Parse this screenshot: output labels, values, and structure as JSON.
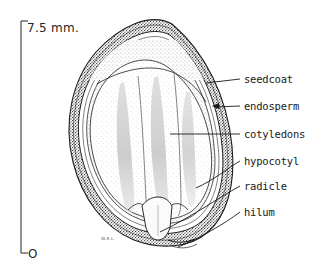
{
  "figure": {
    "kind": "botanical-seed-cross-section-diagram",
    "background_color": "#ffffff",
    "ink_color": "#1a1a1a",
    "signature": "W.R.L."
  },
  "scale": {
    "top_label": "7.5 mm.",
    "bottom_label": "O",
    "bar_color": "#3a3a3a"
  },
  "labels": [
    {
      "id": "seedcoat",
      "text": "seedcoat"
    },
    {
      "id": "endosperm",
      "text": "endosperm"
    },
    {
      "id": "cotyledons",
      "text": "cotyledons"
    },
    {
      "id": "hypocotyl",
      "text": "hypocotyl"
    },
    {
      "id": "radicle",
      "text": "radicle"
    },
    {
      "id": "hilum",
      "text": "hilum"
    }
  ]
}
